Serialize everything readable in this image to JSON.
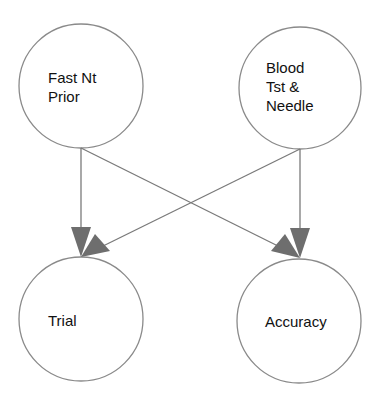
{
  "diagram": {
    "type": "directed-graph",
    "colors": {
      "node_stroke": "#8a8a8a",
      "edge": "#7a7a7a",
      "arrowhead": "#6e6e6e",
      "text": "#111111",
      "background": "#ffffff"
    },
    "nodes": [
      {
        "id": "fast",
        "label": "Fast Nt\nPrior"
      },
      {
        "id": "blood",
        "label": "Blood\nTst &\nNeedle"
      },
      {
        "id": "trial",
        "label": "Trial"
      },
      {
        "id": "accuracy",
        "label": "Accuracy"
      }
    ],
    "edges": [
      {
        "from": "fast",
        "to": "trial"
      },
      {
        "from": "fast",
        "to": "accuracy"
      },
      {
        "from": "blood",
        "to": "trial"
      },
      {
        "from": "blood",
        "to": "accuracy"
      }
    ]
  }
}
